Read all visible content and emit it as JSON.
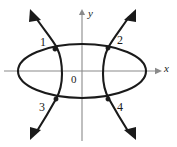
{
  "figure": {
    "kind": "math-graph",
    "background_color": "#ffffff",
    "curve_color": "#1a1a1a",
    "axis_color": "#8a8a8a"
  },
  "axes": {
    "x_label": "x",
    "y_label": "y",
    "origin_label": "0",
    "x_axis": {
      "name": "x-axis",
      "y_pixel": 71,
      "x_start": 4,
      "x_end": 158,
      "arrow": "right"
    },
    "y_axis": {
      "name": "y-axis",
      "x_pixel": 82,
      "y_start": 140,
      "y_end": 11,
      "arrow": "up"
    }
  },
  "points": [
    {
      "id": "1",
      "label": "1",
      "x": 55,
      "y": 49,
      "label_x": 40,
      "label_y": 36
    },
    {
      "id": "2",
      "label": "2",
      "x": 108,
      "y": 48,
      "label_x": 117,
      "label_y": 34
    },
    {
      "id": "3",
      "label": "3",
      "x": 56,
      "y": 99,
      "label_x": 39,
      "label_y": 101
    },
    {
      "id": "4",
      "label": "4",
      "x": 108,
      "y": 99,
      "label_x": 117,
      "label_y": 101
    }
  ],
  "shapes": {
    "ellipse": {
      "name": "ellipse",
      "cx": 82,
      "cy": 71,
      "rx": 64,
      "ry": 27
    },
    "left_curve": {
      "name": "left-parabolic-curve",
      "vertex_x": 62,
      "top_arrow": [
        32,
        14
      ],
      "bottom_arrow": [
        33,
        136
      ]
    },
    "right_curve": {
      "name": "right-parabolic-curve",
      "vertex_x": 102,
      "top_arrow": [
        133,
        13
      ],
      "bottom_arrow": [
        134,
        136
      ]
    }
  },
  "arrow_heads": {
    "count": 4,
    "directions": [
      "up-left",
      "up-right",
      "down-left",
      "down-right"
    ]
  }
}
